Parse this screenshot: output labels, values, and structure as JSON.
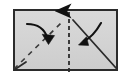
{
  "diagram": {
    "kind": "origami-fold-step",
    "title": "Paper folding step diagram",
    "canvas": {
      "width": 130,
      "height": 79
    },
    "colors": {
      "page_background": "#ffffff",
      "sheet_fill": "#d2d2d2",
      "sheet_fill_light": "#dcdcdc",
      "sheet_border": "#2b2b2b",
      "fold_line": "#3a3a3a",
      "arrow_stroke": "#111111",
      "arrow_fill": "#111111"
    },
    "sheet": {
      "label": "paper-sheet",
      "x": 13,
      "y": 9,
      "width": 105,
      "height": 62,
      "border_width": 2
    },
    "center_fold": {
      "label": "vertical-center-fold",
      "style": "dashed",
      "x": 69,
      "y_top": 11,
      "y_bottom": 72,
      "dash": "4 3",
      "arrowhead": "up",
      "arrowhead_at": {
        "x": 69,
        "y": 8
      }
    },
    "corner_folds": [
      {
        "label": "bottom-left-diagonal-valley",
        "style": "dashed",
        "x1": 14,
        "y1": 69,
        "x2": 62,
        "y2": 22,
        "dash": "5 5"
      },
      {
        "label": "bottom-right-diagonal-mountain",
        "style": "solid",
        "x1": 73,
        "y1": 20,
        "x2": 116,
        "y2": 68
      },
      {
        "label": "bottom-left-corner-crease",
        "style": "solid",
        "x1": 14,
        "y1": 70,
        "x2": 26,
        "y2": 62
      }
    ],
    "motion_arrows": [
      {
        "label": "left-fold-arrow",
        "direction": "down-right",
        "start": {
          "x": 27,
          "y": 24
        },
        "control": {
          "x": 43,
          "y": 25
        },
        "end": {
          "x": 48,
          "y": 40
        },
        "head_angle_deg": 62
      },
      {
        "label": "right-fold-arrow",
        "direction": "down-left",
        "start": {
          "x": 100,
          "y": 24
        },
        "control": {
          "x": 93,
          "y": 40
        },
        "end": {
          "x": 82,
          "y": 43
        },
        "head_angle_deg": 200
      }
    ],
    "annotations": {
      "caption": "",
      "legend": []
    }
  }
}
